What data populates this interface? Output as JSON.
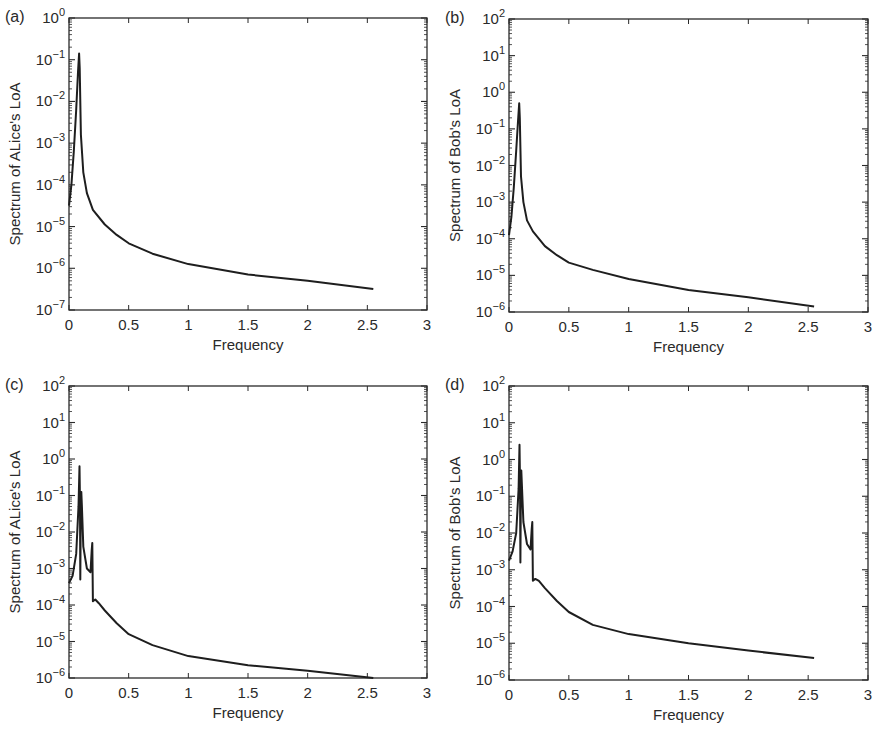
{
  "figure": {
    "panels": [
      {
        "id": "a",
        "label": "(a)",
        "ylabel": "Spectrum of ALice's LoA",
        "xlabel": "Frequency"
      },
      {
        "id": "b",
        "label": "(b)",
        "ylabel": "Spectrum of Bob's LoA",
        "xlabel": "Frequency"
      },
      {
        "id": "c",
        "label": "(c)",
        "ylabel": "Spectrum of ALice's LoA",
        "xlabel": "Frequency"
      },
      {
        "id": "d",
        "label": "(d)",
        "ylabel": "Spectrum of Bob's LoA",
        "xlabel": "Frequency"
      }
    ]
  },
  "chart_data": [
    {
      "panel": "(a)",
      "type": "line",
      "title": "",
      "xlabel": "Frequency",
      "ylabel": "Spectrum of ALice's LoA",
      "yscale": "log",
      "xlim": [
        0,
        3
      ],
      "ylim_exp": [
        -7,
        0
      ],
      "x_ticks": [
        "0",
        "0.5",
        "1",
        "1.5",
        "2",
        "2.5",
        "3"
      ],
      "y_ticks": [
        "10^-7",
        "10^-6",
        "10^-5",
        "10^-4",
        "10^-3",
        "10^-2",
        "10^-1",
        "10^0"
      ],
      "grid": false,
      "legend": null,
      "series": [
        {
          "name": "spectrum",
          "x": [
            0.0,
            0.02,
            0.04,
            0.06,
            0.075,
            0.085,
            0.09,
            0.1,
            0.12,
            0.15,
            0.2,
            0.3,
            0.4,
            0.5,
            0.7,
            1.0,
            1.5,
            2.0,
            2.55
          ],
          "log10y": [
            -4.5,
            -4.0,
            -3.2,
            -2.2,
            -1.3,
            -0.85,
            -1.2,
            -2.8,
            -3.7,
            -4.2,
            -4.6,
            -4.95,
            -5.2,
            -5.4,
            -5.65,
            -5.9,
            -6.15,
            -6.3,
            -6.5
          ]
        }
      ]
    },
    {
      "panel": "(b)",
      "type": "line",
      "title": "",
      "xlabel": "Frequency",
      "ylabel": "Spectrum of Bob's LoA",
      "yscale": "log",
      "xlim": [
        0,
        3
      ],
      "ylim_exp": [
        -6,
        2
      ],
      "x_ticks": [
        "0",
        "0.5",
        "1",
        "1.5",
        "2",
        "2.5",
        "3"
      ],
      "y_ticks": [
        "10^-6",
        "10^-5",
        "10^-4",
        "10^-3",
        "10^-2",
        "10^-1",
        "10^0",
        "10^1",
        "10^2"
      ],
      "grid": false,
      "legend": null,
      "series": [
        {
          "name": "spectrum",
          "x": [
            0.0,
            0.02,
            0.04,
            0.06,
            0.075,
            0.085,
            0.09,
            0.1,
            0.12,
            0.15,
            0.2,
            0.3,
            0.4,
            0.5,
            0.7,
            1.0,
            1.5,
            2.0,
            2.55
          ],
          "log10y": [
            -3.9,
            -3.4,
            -2.6,
            -1.6,
            -0.8,
            -0.3,
            -0.7,
            -2.3,
            -3.0,
            -3.5,
            -3.8,
            -4.2,
            -4.45,
            -4.65,
            -4.85,
            -5.1,
            -5.4,
            -5.6,
            -5.85
          ]
        }
      ]
    },
    {
      "panel": "(c)",
      "type": "line",
      "title": "",
      "xlabel": "Frequency",
      "ylabel": "Spectrum of ALice's LoA",
      "yscale": "log",
      "xlim": [
        0,
        3
      ],
      "ylim_exp": [
        -6,
        2
      ],
      "x_ticks": [
        "0",
        "0.5",
        "1",
        "1.5",
        "2",
        "2.5",
        "3"
      ],
      "y_ticks": [
        "10^-6",
        "10^-5",
        "10^-4",
        "10^-3",
        "10^-2",
        "10^-1",
        "10^0",
        "10^1",
        "10^2"
      ],
      "grid": false,
      "legend": null,
      "series": [
        {
          "name": "spectrum",
          "x": [
            0.0,
            0.03,
            0.06,
            0.08,
            0.088,
            0.092,
            0.095,
            0.1,
            0.103,
            0.108,
            0.12,
            0.15,
            0.18,
            0.19,
            0.195,
            0.2,
            0.22,
            0.25,
            0.3,
            0.4,
            0.5,
            0.7,
            1.0,
            1.5,
            2.0,
            2.55
          ],
          "log10y": [
            -3.4,
            -3.2,
            -2.6,
            -1.3,
            -0.2,
            -1.2,
            -3.3,
            -1.0,
            -0.9,
            -1.3,
            -2.4,
            -3.0,
            -3.1,
            -2.5,
            -2.3,
            -3.9,
            -3.85,
            -3.95,
            -4.15,
            -4.5,
            -4.8,
            -5.1,
            -5.4,
            -5.65,
            -5.8,
            -6.0
          ]
        }
      ]
    },
    {
      "panel": "(d)",
      "type": "line",
      "title": "",
      "xlabel": "Frequency",
      "ylabel": "Spectrum of Bob's LoA",
      "yscale": "log",
      "xlim": [
        0,
        3
      ],
      "ylim_exp": [
        -6,
        2
      ],
      "x_ticks": [
        "0",
        "0.5",
        "1",
        "1.5",
        "2",
        "2.5",
        "3"
      ],
      "y_ticks": [
        "10^-6",
        "10^-5",
        "10^-4",
        "10^-3",
        "10^-2",
        "10^-1",
        "10^0",
        "10^1",
        "10^2"
      ],
      "grid": false,
      "legend": null,
      "series": [
        {
          "name": "spectrum",
          "x": [
            0.0,
            0.03,
            0.06,
            0.08,
            0.088,
            0.092,
            0.095,
            0.1,
            0.103,
            0.108,
            0.12,
            0.15,
            0.18,
            0.19,
            0.195,
            0.2,
            0.22,
            0.25,
            0.3,
            0.4,
            0.5,
            0.7,
            1.0,
            1.5,
            2.0,
            2.55
          ],
          "log10y": [
            -2.75,
            -2.5,
            -2.0,
            -0.8,
            0.4,
            -0.6,
            -2.8,
            -0.35,
            -0.3,
            -0.7,
            -1.7,
            -2.3,
            -2.45,
            -1.9,
            -1.7,
            -3.3,
            -3.25,
            -3.3,
            -3.5,
            -3.85,
            -4.15,
            -4.5,
            -4.75,
            -5.0,
            -5.2,
            -5.4
          ]
        }
      ]
    }
  ]
}
